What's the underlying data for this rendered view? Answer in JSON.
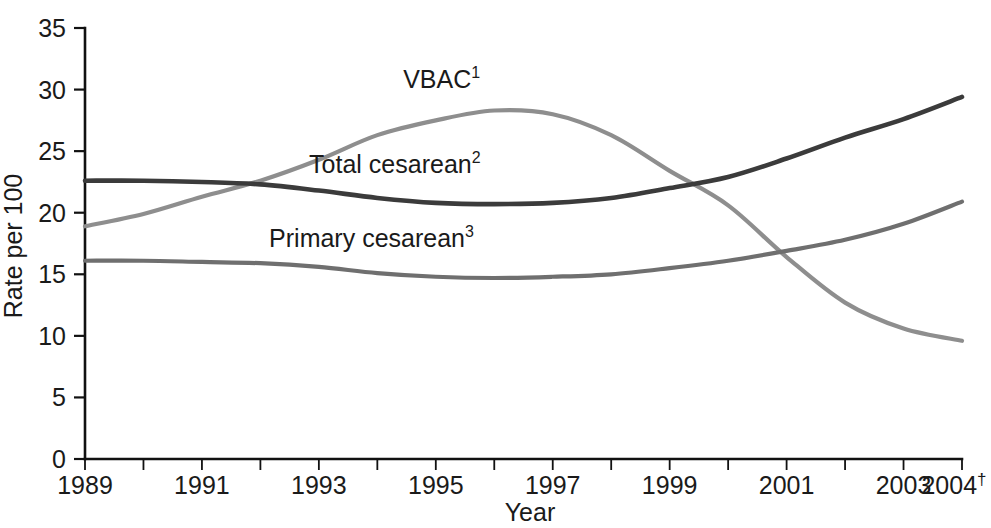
{
  "chart_data": {
    "type": "line",
    "title": "",
    "xlabel": "Year",
    "ylabel": "Rate per 100",
    "xlim": [
      1989,
      2004
    ],
    "ylim": [
      0,
      35
    ],
    "grid": false,
    "legend_position": "inline-labels",
    "y_ticks": [
      "0",
      "5",
      "10",
      "15",
      "20",
      "25",
      "30",
      "35"
    ],
    "y_tick_values": [
      0,
      5,
      10,
      15,
      20,
      25,
      30,
      35
    ],
    "x_ticks": [
      "1989",
      "1991",
      "1993",
      "1995",
      "1997",
      "1999",
      "2001",
      "2003",
      "2004"
    ],
    "x_tick_values": [
      1989,
      1991,
      1993,
      1995,
      1997,
      1999,
      2001,
      2003,
      2004
    ],
    "x_last_tick_superscript": "†",
    "x_all_tick_values": [
      1989,
      1990,
      1991,
      1992,
      1993,
      1994,
      1995,
      1996,
      1997,
      1998,
      1999,
      2000,
      2001,
      2002,
      2003,
      2004
    ],
    "x": [
      1989,
      1990,
      1991,
      1992,
      1993,
      1994,
      1995,
      1996,
      1997,
      1998,
      1999,
      2000,
      2001,
      2002,
      2003,
      2004
    ],
    "series": [
      {
        "name": "VBAC",
        "label": "VBAC",
        "superscript": "1",
        "color": "#8e8e8e",
        "stroke_width": 4.2,
        "label_x": 1995.1,
        "label_y": 30.1,
        "values": [
          18.9,
          19.9,
          21.3,
          22.6,
          24.3,
          26.3,
          27.5,
          28.3,
          28.0,
          26.3,
          23.4,
          20.6,
          16.4,
          12.7,
          10.6,
          9.6
        ]
      },
      {
        "name": "Total cesarean",
        "label": "Total cesarean",
        "superscript": "2",
        "color": "#3b3b3b",
        "stroke_width": 4.6,
        "label_x": 1994.3,
        "label_y": 23.2,
        "values": [
          22.6,
          22.6,
          22.5,
          22.3,
          21.8,
          21.2,
          20.8,
          20.7,
          20.8,
          21.2,
          22.0,
          22.9,
          24.4,
          26.1,
          27.6,
          29.4
        ]
      },
      {
        "name": "Primary cesarean",
        "label": "Primary cesarean",
        "superscript": "3",
        "color": "#6f6f6f",
        "stroke_width": 4.2,
        "label_x": 1993.9,
        "label_y": 17.2,
        "values": [
          16.1,
          16.1,
          16.0,
          15.9,
          15.6,
          15.1,
          14.8,
          14.7,
          14.8,
          15.0,
          15.5,
          16.1,
          16.9,
          17.8,
          19.1,
          20.9
        ]
      }
    ]
  },
  "axis": {
    "y_label": "Rate per 100",
    "x_label": "Year"
  }
}
